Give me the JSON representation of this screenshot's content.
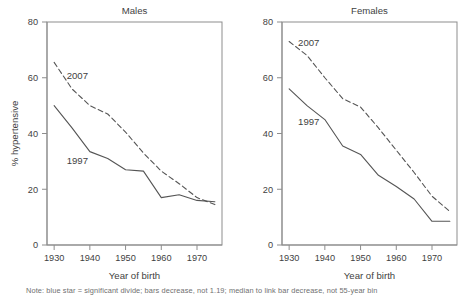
{
  "figure": {
    "background_color": "#ffffff",
    "line_color": "#555555",
    "text_color": "#3f3f3f",
    "caption": "Note: blue star = significant divide; bars decrease, not 1.19; median to link bar decrease, not 55-year bin"
  },
  "chart_data": [
    {
      "type": "line",
      "title": "Males",
      "xlabel": "Year of birth",
      "ylabel": "% hypertensive",
      "xlim": [
        1928,
        1977
      ],
      "ylim": [
        0,
        80
      ],
      "xticks": [
        1930,
        1940,
        1950,
        1960,
        1970
      ],
      "xticklabels": [
        "1930",
        "1940",
        "1950",
        "1960",
        "1970"
      ],
      "yticks": [
        0,
        20,
        40,
        60,
        80
      ],
      "yticklabels": [
        "0",
        "20",
        "40",
        "60",
        "80"
      ],
      "grid": false,
      "legend": "inline-annotations",
      "x": [
        1930,
        1935,
        1940,
        1945,
        1950,
        1955,
        1960,
        1965,
        1970,
        1975
      ],
      "series": [
        {
          "name": "2007",
          "style": "dashed",
          "label_x": 1936.5,
          "label_y": 59.5,
          "values": [
            65.5,
            56.0,
            50.0,
            47.0,
            40.5,
            33.0,
            26.5,
            22.0,
            17.0,
            14.5
          ]
        },
        {
          "name": "1997",
          "style": "solid",
          "label_x": 1936.5,
          "label_y": 29.0,
          "values": [
            50.0,
            42.0,
            33.5,
            31.0,
            27.0,
            26.5,
            17.0,
            18.0,
            16.0,
            15.5
          ]
        }
      ]
    },
    {
      "type": "line",
      "title": "Females",
      "xlabel": "Year of birth",
      "ylabel": "",
      "xlim": [
        1928,
        1977
      ],
      "ylim": [
        0,
        80
      ],
      "xticks": [
        1930,
        1940,
        1950,
        1960,
        1970
      ],
      "xticklabels": [
        "1930",
        "1940",
        "1950",
        "1960",
        "1970"
      ],
      "yticks": [
        0,
        20,
        40,
        60,
        80
      ],
      "yticklabels": [
        "0",
        "20",
        "40",
        "60",
        "80"
      ],
      "grid": false,
      "legend": "inline-annotations",
      "x": [
        1930,
        1935,
        1940,
        1945,
        1950,
        1955,
        1960,
        1965,
        1970,
        1975
      ],
      "series": [
        {
          "name": "2007",
          "style": "dashed",
          "label_x": 1935.5,
          "label_y": 71.5,
          "values": [
            73.0,
            68.0,
            60.0,
            52.5,
            49.5,
            42.0,
            34.0,
            26.0,
            17.5,
            12.0
          ]
        },
        {
          "name": "1997",
          "style": "solid",
          "label_x": 1935.5,
          "label_y": 43.0,
          "values": [
            56.0,
            50.0,
            45.0,
            35.5,
            32.5,
            25.0,
            21.0,
            16.5,
            8.5,
            8.5
          ]
        }
      ]
    }
  ]
}
